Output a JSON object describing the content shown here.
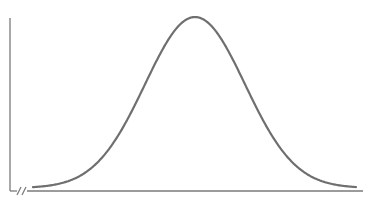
{
  "figure": {
    "type": "normal-distribution-curve",
    "title": "",
    "xlabel": "",
    "ylabel": "",
    "colors": {
      "axis": "#7a7a7a",
      "curve": "#6f6f6f",
      "background": "#ffffff"
    }
  },
  "chart_data": {
    "type": "line",
    "title": "",
    "xlabel": "",
    "ylabel": "",
    "series": [
      {
        "name": "normal distribution",
        "shape": "gaussian",
        "center_px": 195,
        "sigma_px": 50,
        "peak_y_px": 17,
        "baseline_y_px": 188,
        "x_start_px": 33,
        "x_end_px": 356
      }
    ],
    "axes": {
      "y_axis": {
        "x_px": 10,
        "y_top_px": 18,
        "y_bottom_px": 191
      },
      "x_axis": {
        "y_px": 191,
        "x_left_px": 10,
        "x_right_px": 363,
        "break_mark": "//"
      }
    },
    "grid": false,
    "legend": null
  }
}
